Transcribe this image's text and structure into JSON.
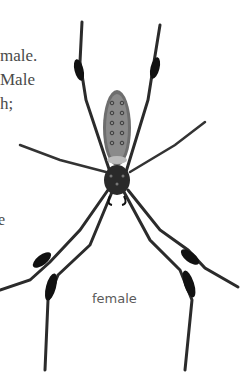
{
  "text_fragments": {
    "line1": "male.",
    "line2": "Male",
    "line3": "h;",
    "line4": "e"
  },
  "illustration": {
    "subject": "spider-icon",
    "caption": "female"
  }
}
